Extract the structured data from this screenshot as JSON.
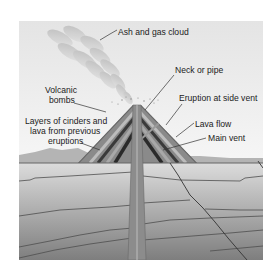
{
  "diagram": {
    "labels": {
      "ash_cloud": "Ash and gas cloud",
      "neck": "Neck or pipe",
      "bombs_1": "Volcanic",
      "bombs_2": "bombs",
      "side_vent": "Eruption at side vent",
      "layers_1": "Layers of cinders and",
      "layers_2": "lava from previous",
      "layers_3": "eruptions",
      "lava_flow": "Lava flow",
      "main_vent": "Main vent"
    },
    "colors": {
      "sky_top": "#e6e6e6",
      "sky_bottom": "#f4f4f4",
      "cloud": "#c8c8c8",
      "cone_dark": "#3a3a3a",
      "cone_mid": "#6e6e6e",
      "cone_light": "#9a9a9a",
      "ground_light": "#d6d6d6",
      "ground_dark": "#7a7a7a",
      "strata_line": "#555555",
      "pipe": "#8c8c8c"
    }
  }
}
